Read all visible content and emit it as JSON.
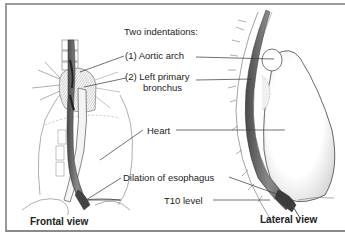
{
  "figure": {
    "heading": "Two indentations:",
    "labels": {
      "aortic_arch": "(1) Aortic arch",
      "left_bronchus_line1": "(2) Left primary",
      "left_bronchus_line2": "bronchus",
      "heart": "Heart",
      "dilation": "Dilation of esophagus",
      "t10": "T10 level"
    },
    "views": {
      "frontal": "Frontal view",
      "lateral": "Lateral view"
    }
  },
  "colors": {
    "frame": "#9a9a9a",
    "ink": "#222222",
    "esophagus_shade": "#6a6a6a",
    "tissue_shade": "#d8d8d8"
  }
}
